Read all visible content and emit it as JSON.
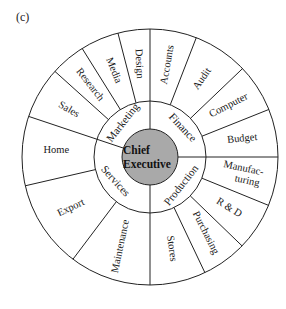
{
  "figure_label": "(c)",
  "diagram": {
    "type": "circular organisation chart",
    "core": {
      "lines": [
        "Chief",
        "Executive"
      ],
      "fill": "#a9a9a9"
    },
    "divisions": [
      {
        "name": "Marketing",
        "departments": [
          "Sales",
          "Research",
          "Media",
          "Design"
        ]
      },
      {
        "name": "Finance",
        "departments": [
          "Accounts",
          "Audit",
          "Computer",
          "Budget"
        ]
      },
      {
        "name": "Production",
        "departments": [
          "Manufac-\nturing",
          "R & D",
          "Purchasing",
          "Stores"
        ]
      },
      {
        "name": "Services",
        "departments": [
          "Maintenance",
          "Export",
          "Home"
        ]
      }
    ]
  }
}
